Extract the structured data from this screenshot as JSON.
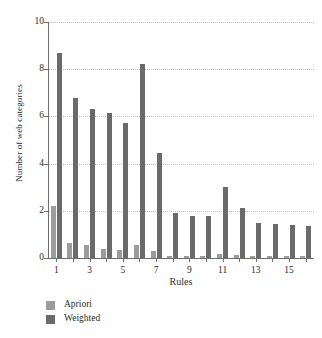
{
  "chart_data": {
    "type": "bar",
    "title": "",
    "xlabel": "Rules",
    "ylabel": "Number of web categories",
    "categories": [
      "1",
      "2",
      "3",
      "4",
      "5",
      "6",
      "7",
      "8",
      "9",
      "10",
      "11",
      "12",
      "13",
      "14",
      "15",
      "16"
    ],
    "xtick_labels": [
      "1",
      "3",
      "5",
      "7",
      "9",
      "11",
      "13",
      "15"
    ],
    "xtick_categories": [
      "1",
      "3",
      "5",
      "7",
      "9",
      "11",
      "13",
      "15"
    ],
    "ytick_labels": [
      "0",
      "2",
      "4",
      "6",
      "8",
      "10"
    ],
    "ylim": [
      0,
      10
    ],
    "xlim_count": 16,
    "grid": "horizontal-dotted",
    "legend_position": "below-left",
    "series": [
      {
        "name": "Apriori",
        "color": "#9c9c9c",
        "values": [
          2.2,
          0.65,
          0.55,
          0.4,
          0.35,
          0.55,
          0.28,
          0.1,
          0.07,
          0.1,
          0.18,
          0.12,
          0.08,
          0.07,
          0.07,
          0.07
        ]
      },
      {
        "name": "Weighted",
        "color": "#6a6a6a",
        "values": [
          8.7,
          6.8,
          6.3,
          6.15,
          5.7,
          8.2,
          4.45,
          1.9,
          1.8,
          1.8,
          3.0,
          2.1,
          1.5,
          1.45,
          1.4,
          1.35
        ]
      }
    ]
  },
  "legend": {
    "items": [
      {
        "label": "Apriori",
        "color": "#9c9c9c"
      },
      {
        "label": "Weighted",
        "color": "#6a6a6a"
      }
    ]
  },
  "axes": {
    "xlabel": "Rules",
    "ylabel": "Number of web categories"
  }
}
